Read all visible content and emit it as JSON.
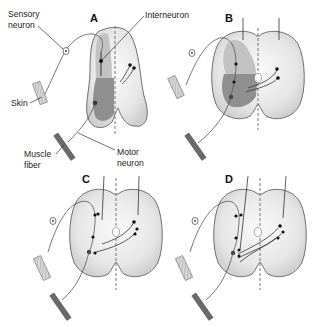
{
  "figure": {
    "panels": [
      {
        "id": "A",
        "label": "A"
      },
      {
        "id": "B",
        "label": "B"
      },
      {
        "id": "C",
        "label": "C"
      },
      {
        "id": "D",
        "label": "D"
      }
    ],
    "labels": {
      "sensory_neuron_line1": "Sensory",
      "sensory_neuron_line2": "neuron",
      "interneuron": "Interneuron",
      "skin": "Skin",
      "muscle_fiber_line1": "Muscle",
      "muscle_fiber_line2": "fiber",
      "motor_neuron_line1": "Motor",
      "motor_neuron_line2": "neuron"
    },
    "colors": {
      "cord_fill": "#ececec",
      "cord_stroke": "#6e6e6e",
      "grey_matter_light": "#bdbdbd",
      "grey_matter_dark": "#8f8f8f",
      "line": "#333333",
      "muscle": "#6a6a6a"
    }
  }
}
